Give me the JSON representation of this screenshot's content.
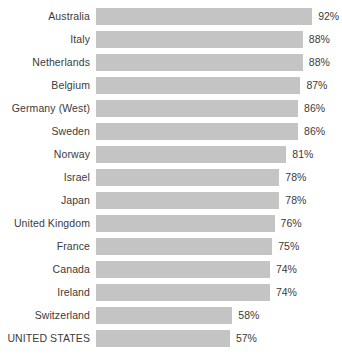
{
  "chart_data": {
    "type": "bar",
    "orientation": "horizontal",
    "title": "",
    "subtitle": "",
    "xlabel": "",
    "ylabel": "",
    "grid": false,
    "legend": null,
    "xlim": [
      0,
      100
    ],
    "value_suffix": "%",
    "bar_color": "#c4c4c4",
    "label_color": "#3b3b3b",
    "background": "#ffffff",
    "categories": [
      "Australia",
      "Italy",
      "Netherlands",
      "Belgium",
      "Germany (West)",
      "Sweden",
      "Norway",
      "Israel",
      "Japan",
      "United Kingdom",
      "France",
      "Canada",
      "Ireland",
      "Switzerland",
      "UNITED STATES"
    ],
    "values": [
      92,
      88,
      88,
      87,
      86,
      86,
      81,
      78,
      78,
      76,
      75,
      74,
      74,
      58,
      57
    ],
    "value_labels": [
      "92%",
      "88%",
      "88%",
      "87%",
      "86%",
      "86%",
      "81%",
      "78%",
      "78%",
      "76%",
      "75%",
      "74%",
      "74%",
      "58%",
      "57%"
    ],
    "rows": [
      {
        "category": "Australia",
        "value": 92,
        "value_label": "92%"
      },
      {
        "category": "Italy",
        "value": 88,
        "value_label": "88%"
      },
      {
        "category": "Netherlands",
        "value": 88,
        "value_label": "88%"
      },
      {
        "category": "Belgium",
        "value": 87,
        "value_label": "87%"
      },
      {
        "category": "Germany (West)",
        "value": 86,
        "value_label": "86%"
      },
      {
        "category": "Sweden",
        "value": 86,
        "value_label": "86%"
      },
      {
        "category": "Norway",
        "value": 81,
        "value_label": "81%"
      },
      {
        "category": "Israel",
        "value": 78,
        "value_label": "78%"
      },
      {
        "category": "Japan",
        "value": 78,
        "value_label": "78%"
      },
      {
        "category": "United Kingdom",
        "value": 76,
        "value_label": "76%"
      },
      {
        "category": "France",
        "value": 75,
        "value_label": "75%"
      },
      {
        "category": "Canada",
        "value": 74,
        "value_label": "74%"
      },
      {
        "category": "Ireland",
        "value": 74,
        "value_label": "74%"
      },
      {
        "category": "Switzerland",
        "value": 58,
        "value_label": "58%"
      },
      {
        "category": "UNITED STATES",
        "value": 57,
        "value_label": "57%"
      }
    ]
  }
}
